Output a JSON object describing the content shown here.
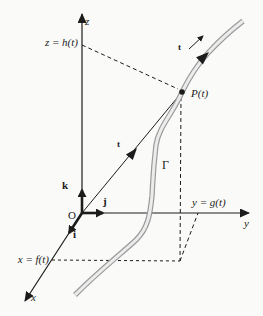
{
  "figure": {
    "colors": {
      "ink": "#1c1c1c",
      "curve_outline": "#9a9a9a",
      "curve_fill": "#ececec",
      "background": "#fafaf8"
    },
    "axes": {
      "z_label": "z",
      "y_label": "y",
      "x_label": "x"
    },
    "coordinate_labels": {
      "z_eq": "z = h(t)",
      "y_eq": "y = g(t)",
      "x_eq": "x = f(t)"
    },
    "points": {
      "origin": "O",
      "point_on_curve": "P(t)"
    },
    "curve": {
      "name": "Γ"
    },
    "basis_vectors": {
      "i": "i",
      "j": "j",
      "k": "k"
    },
    "parameter_labels": {
      "radius_arrow": "t",
      "tangent_arrow": "t"
    }
  }
}
